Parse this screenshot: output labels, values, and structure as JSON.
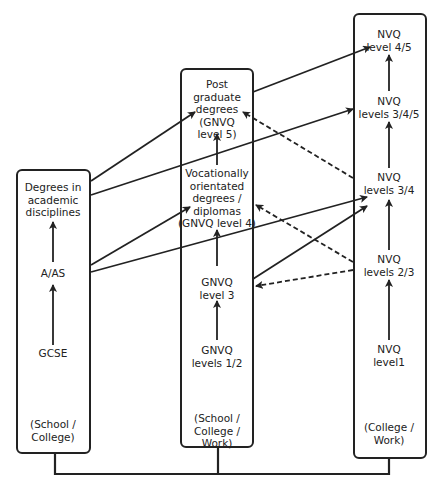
{
  "diagram": {
    "type": "qualification-progression-flow",
    "columns": [
      {
        "id": "academic",
        "setting": "(School / College)",
        "nodes": [
          {
            "id": "degrees_academic",
            "label": "Degrees in academic disciplines"
          },
          {
            "id": "a_as",
            "label": "A/AS"
          },
          {
            "id": "gcse",
            "label": "GCSE"
          }
        ]
      },
      {
        "id": "gnvq",
        "setting": "(School / College / Work)",
        "nodes": [
          {
            "id": "postgrad",
            "label": "Post graduate degrees (GNVQ level 5)"
          },
          {
            "id": "vocational",
            "label": "Vocationally orientated degrees / diplomas (GNVQ level 4)"
          },
          {
            "id": "gnvq3",
            "label": "GNVQ level 3"
          },
          {
            "id": "gnvq12",
            "label": "GNVQ levels 1/2"
          }
        ]
      },
      {
        "id": "nvq",
        "setting": "(College / Work)",
        "nodes": [
          {
            "id": "nvq45",
            "label": "NVQ level 4/5"
          },
          {
            "id": "nvq345",
            "label": "NVQ levels 3/4/5"
          },
          {
            "id": "nvq34",
            "label": "NVQ levels 3/4"
          },
          {
            "id": "nvq23",
            "label": "NVQ levels 2/3"
          },
          {
            "id": "nvq1",
            "label": "NVQ level1"
          }
        ]
      }
    ],
    "edges": [
      {
        "from": "gcse",
        "to": "a_as",
        "style": "solid"
      },
      {
        "from": "a_as",
        "to": "degrees_academic",
        "style": "solid"
      },
      {
        "from": "gnvq12",
        "to": "gnvq3",
        "style": "solid"
      },
      {
        "from": "gnvq3",
        "to": "vocational",
        "style": "solid"
      },
      {
        "from": "vocational",
        "to": "postgrad",
        "style": "solid"
      },
      {
        "from": "nvq1",
        "to": "nvq23",
        "style": "solid"
      },
      {
        "from": "nvq23",
        "to": "nvq34",
        "style": "solid"
      },
      {
        "from": "nvq34",
        "to": "nvq345",
        "style": "solid"
      },
      {
        "from": "nvq345",
        "to": "nvq45",
        "style": "solid"
      },
      {
        "from": "degrees_academic",
        "to": "postgrad",
        "style": "solid"
      },
      {
        "from": "degrees_academic",
        "to": "nvq345",
        "style": "solid"
      },
      {
        "from": "a_as",
        "to": "vocational",
        "style": "solid"
      },
      {
        "from": "a_as",
        "to": "nvq34",
        "style": "solid"
      },
      {
        "from": "postgrad",
        "to": "nvq45",
        "style": "solid"
      },
      {
        "from": "gnvq3",
        "to": "nvq34",
        "style": "solid"
      },
      {
        "from": "nvq34",
        "to": "postgrad",
        "style": "dashed"
      },
      {
        "from": "nvq23",
        "to": "vocational",
        "style": "dashed"
      },
      {
        "from": "nvq23",
        "to": "gnvq3",
        "style": "dashed"
      }
    ]
  },
  "labels": {
    "degrees_academic": [
      "Degrees in",
      "academic",
      "disciplines"
    ],
    "a_as": [
      "A/AS"
    ],
    "gcse": [
      "GCSE"
    ],
    "setting_left": [
      "(School /",
      "College)"
    ],
    "postgrad": [
      "Post",
      "graduate",
      "degrees",
      "(GNVQ",
      "level 5)"
    ],
    "vocational": [
      "Vocationally",
      "orientated",
      "degrees /",
      "diplomas",
      "(GNVQ level 4)"
    ],
    "gnvq3": [
      "GNVQ",
      "level 3"
    ],
    "gnvq12": [
      "GNVQ",
      "levels 1/2"
    ],
    "setting_mid": [
      "(School /",
      "College /",
      "Work)"
    ],
    "nvq45": [
      "NVQ",
      "level 4/5"
    ],
    "nvq345": [
      "NVQ",
      "levels 3/4/5"
    ],
    "nvq34": [
      "NVQ",
      "levels 3/4"
    ],
    "nvq23": [
      "NVQ",
      "levels 2/3"
    ],
    "nvq1": [
      "NVQ",
      "level1"
    ],
    "setting_right": [
      "(College /",
      "Work)"
    ]
  }
}
